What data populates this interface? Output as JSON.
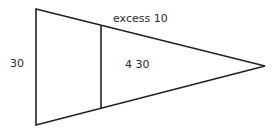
{
  "diagram": {
    "type": "triangle-divided",
    "stroke_color": "#222222",
    "text_color": "#2a2a2a",
    "background": "#ffffff",
    "shapes": {
      "triangle": {
        "vertices": [
          [
            36,
            9
          ],
          [
            265,
            66
          ],
          [
            36,
            125
          ]
        ]
      },
      "divider_line": {
        "from": [
          101,
          26
        ],
        "to": [
          101,
          108
        ]
      }
    },
    "labels": {
      "top_edge": "excess 10",
      "inner_region": "4 30",
      "left_side": "30"
    }
  }
}
